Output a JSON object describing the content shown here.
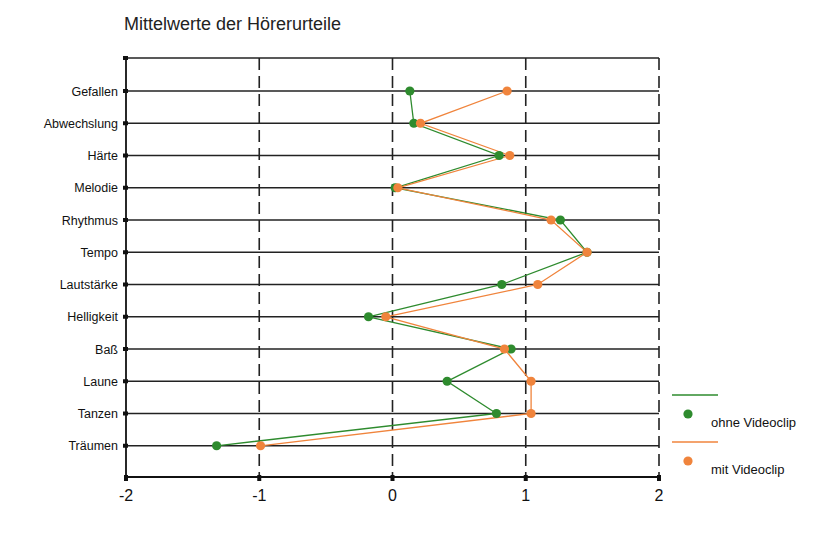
{
  "chart_data": {
    "type": "line",
    "orientation": "horizontal",
    "title": "Mittelwerte der Hörerurteile",
    "xlabel": "",
    "ylabel": "",
    "xlim": [
      -2,
      2
    ],
    "xticks": [
      -2,
      -1,
      0,
      1,
      2
    ],
    "xtick_labels": [
      "-2",
      "-1",
      "0",
      "1",
      "2"
    ],
    "grid": {
      "horizontal": "solid",
      "vertical": "dashed"
    },
    "legend_position": "right-bottom",
    "categories": [
      "Gefallen",
      "Abwechslung",
      "Härte",
      "Melodie",
      "Rhythmus",
      "Tempo",
      "Lautstärke",
      "Helligkeit",
      "Baß",
      "Laune",
      "Tanzen",
      "Träumen"
    ],
    "series": [
      {
        "name": "ohne Videoclip",
        "color": "#2e8b2e",
        "values": [
          0.13,
          0.16,
          0.8,
          0.02,
          1.26,
          1.46,
          0.82,
          -0.18,
          0.89,
          0.41,
          0.78,
          -1.32
        ]
      },
      {
        "name": "mit Videoclip",
        "color": "#f0843c",
        "values": [
          0.86,
          0.21,
          0.88,
          0.04,
          1.19,
          1.46,
          1.09,
          -0.05,
          0.84,
          1.04,
          1.04,
          -0.99
        ]
      }
    ]
  }
}
